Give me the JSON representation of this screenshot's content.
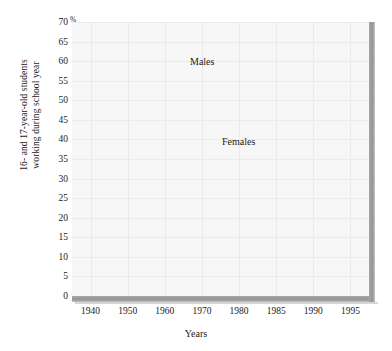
{
  "chart_data": {
    "type": "line",
    "title": "",
    "xlabel": "Years",
    "ylabel": "16- and 17-year-old students working during school year",
    "ylabel_line1": "16- and 17-year-old students",
    "ylabel_line2": "working during school year",
    "unit_symbol": "%",
    "categories": [
      "1940",
      "1950",
      "1960",
      "1970",
      "1980",
      "1985",
      "1990",
      "1995"
    ],
    "x": [
      1940,
      1950,
      1960,
      1970,
      1980,
      1985,
      1990,
      1995
    ],
    "ylim": [
      0,
      70
    ],
    "ytick_step": 5,
    "yticks": [
      "70",
      "65",
      "60",
      "55",
      "50",
      "45",
      "40",
      "35",
      "30",
      "25",
      "20",
      "15",
      "10",
      "5",
      "0"
    ],
    "grid": true,
    "legend_position": "inline-annotations",
    "series": [
      {
        "name": "Males",
        "color": "#3a3a3a",
        "values": [
          5,
          23,
          35,
          40,
          67,
          67,
          67,
          67
        ]
      },
      {
        "name": "Females",
        "color": "#3a3a3a",
        "values": [
          3,
          13,
          23,
          33,
          65,
          66,
          66.5,
          67
        ]
      }
    ],
    "annotations": [
      {
        "text": "Males",
        "series": "Males"
      },
      {
        "text": "Females",
        "series": "Females"
      }
    ]
  },
  "colors": {
    "line": "#3a3a3a",
    "axis_bar": "#949494",
    "plot_background": "#f7f7f7",
    "gridline": "#ebebeb",
    "text": "#1b1b1b"
  }
}
